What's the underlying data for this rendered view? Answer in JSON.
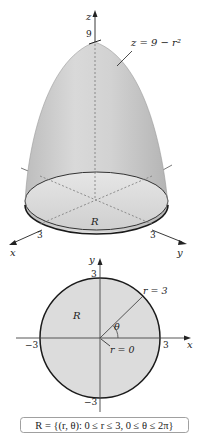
{
  "figure_top": {
    "title": "Solid under paraboloid",
    "surface_label": "z = 9 − r²",
    "axis_z_label": "z",
    "axis_x_label": "x",
    "axis_y_label": "y",
    "z_tick": "9",
    "x_tick": "3",
    "y_tick": "3",
    "region_label": "R",
    "surface_color": "#c8c8c8",
    "edge_color": "#2a2a2a"
  },
  "figure_bottom": {
    "axis_x_label": "x",
    "axis_y_label": "y",
    "x_tick_pos": "3",
    "x_tick_neg": "−3",
    "y_tick_pos": "3",
    "y_tick_neg": "−3",
    "region_label": "R",
    "radius_label": "r = 3",
    "origin_label": "r = 0",
    "angle_label": "θ",
    "disk_fill": "#dcdcdc"
  },
  "caption": {
    "text": "R = {(r, θ): 0 ≤ r ≤ 3, 0 ≤ θ ≤ 2π}"
  }
}
